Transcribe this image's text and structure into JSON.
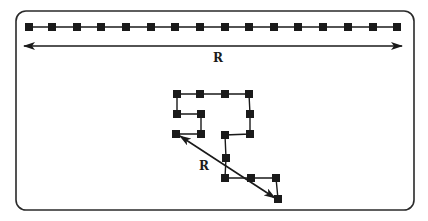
{
  "diagram": {
    "frame": {
      "x": 16,
      "y": 11,
      "width": 398,
      "height": 199,
      "radius": 10,
      "stroke": "#2a2a2a"
    },
    "colors": {
      "ink": "#1a1a1a",
      "background": "#ffffff"
    },
    "extended_chain": {
      "y": 27,
      "node_x": [
        29,
        52,
        77,
        101,
        126,
        151,
        175,
        200,
        225,
        249,
        274,
        298,
        323,
        348,
        373,
        397
      ],
      "node_size": 8
    },
    "extended_arrow": {
      "x1": 24,
      "x2": 402,
      "y": 46,
      "label": "R",
      "label_x": 218,
      "label_y": 62
    },
    "coiled_chain": {
      "nodes": [
        [
          176,
          134
        ],
        [
          201,
          134
        ],
        [
          201,
          114
        ],
        [
          177,
          114
        ],
        [
          177,
          94
        ],
        [
          200,
          94
        ],
        [
          225,
          94
        ],
        [
          249,
          94
        ],
        [
          250,
          114
        ],
        [
          250,
          134
        ],
        [
          225,
          135
        ],
        [
          226,
          158
        ],
        [
          225,
          178
        ],
        [
          251,
          178
        ],
        [
          276,
          178
        ],
        [
          278,
          199
        ]
      ],
      "node_size": 8
    },
    "coiled_arrow": {
      "x1": 180,
      "y1": 136,
      "x2": 275,
      "y2": 198,
      "label": "R",
      "label_x": 204,
      "label_y": 170
    }
  }
}
